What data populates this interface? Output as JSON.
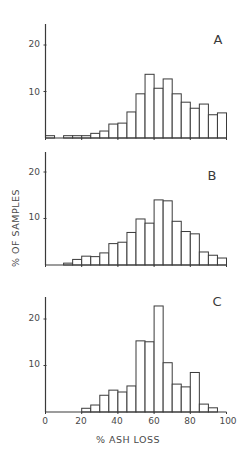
{
  "chart_data": [
    {
      "type": "bar",
      "panel": "A",
      "title": "A",
      "xlabel": "% ASH LOSS",
      "ylabel": "% OF SAMPLES",
      "bin_width": 5,
      "categories": [
        "0-5",
        "5-10",
        "10-15",
        "15-20",
        "20-25",
        "25-30",
        "30-35",
        "35-40",
        "40-45",
        "45-50",
        "50-55",
        "55-60",
        "60-65",
        "65-70",
        "70-75",
        "75-80",
        "80-85",
        "85-90",
        "90-95",
        "95-100"
      ],
      "values": [
        0.5,
        0,
        0.5,
        0.5,
        0.5,
        1.0,
        1.5,
        3.0,
        3.2,
        5.6,
        9.5,
        13.7,
        10.7,
        12.7,
        9.5,
        7.7,
        6.4,
        7.3,
        5.0,
        5.4
      ],
      "xlim": [
        0,
        100
      ],
      "ylim": [
        0,
        24
      ],
      "yticks": [
        10,
        20
      ],
      "xticks": [
        0,
        20,
        40,
        60,
        80,
        100
      ],
      "grid": false
    },
    {
      "type": "bar",
      "panel": "B",
      "title": "B",
      "xlabel": "% ASH LOSS",
      "ylabel": "% OF SAMPLES",
      "bin_width": 5,
      "categories": [
        "0-5",
        "5-10",
        "10-15",
        "15-20",
        "20-25",
        "25-30",
        "30-35",
        "35-40",
        "40-45",
        "45-50",
        "50-55",
        "55-60",
        "60-65",
        "65-70",
        "70-75",
        "75-80",
        "80-85",
        "85-90",
        "90-95",
        "95-100"
      ],
      "values": [
        0,
        0,
        0.4,
        1.2,
        1.9,
        1.8,
        2.6,
        4.6,
        4.9,
        7.0,
        9.9,
        9.0,
        14.0,
        13.8,
        9.4,
        7.2,
        6.7,
        2.8,
        2.1,
        1.5
      ],
      "xlim": [
        0,
        100
      ],
      "ylim": [
        0,
        24
      ],
      "yticks": [
        10,
        20
      ],
      "xticks": [
        0,
        20,
        40,
        60,
        80,
        100
      ],
      "grid": false
    },
    {
      "type": "bar",
      "panel": "C",
      "title": "C",
      "xlabel": "% ASH LOSS",
      "ylabel": "% OF SAMPLES",
      "bin_width": 5,
      "categories": [
        "0-5",
        "5-10",
        "10-15",
        "15-20",
        "20-25",
        "25-30",
        "30-35",
        "35-40",
        "40-45",
        "45-50",
        "50-55",
        "55-60",
        "60-65",
        "65-70",
        "70-75",
        "75-80",
        "80-85",
        "85-90",
        "90-95",
        "95-100"
      ],
      "values": [
        0,
        0,
        0,
        0,
        0.8,
        1.5,
        3.6,
        4.7,
        4.3,
        5.6,
        15.3,
        15.1,
        22.8,
        10.6,
        6.0,
        5.4,
        8.5,
        1.7,
        0.9,
        0
      ],
      "xlim": [
        0,
        100
      ],
      "ylim": [
        0,
        24
      ],
      "yticks": [
        10,
        20
      ],
      "xticks": [
        0,
        20,
        40,
        60,
        80,
        100
      ],
      "xticklabels": [
        "0",
        "20",
        "40",
        "60",
        "80",
        "100"
      ],
      "grid": false
    }
  ],
  "labels": {
    "ylabel": "% OF SAMPLES",
    "xlabel": "% ASH LOSS",
    "panel_a": "A",
    "panel_b": "B",
    "panel_c": "C",
    "ytick_10": "10",
    "ytick_20": "20",
    "xticks": [
      "0",
      "20",
      "40",
      "60",
      "80",
      "100"
    ]
  },
  "colors": {
    "line": "#3a3a3a",
    "text": "#4a4a4a",
    "bar_fill": "#ffffff",
    "background": "#ffffff"
  }
}
